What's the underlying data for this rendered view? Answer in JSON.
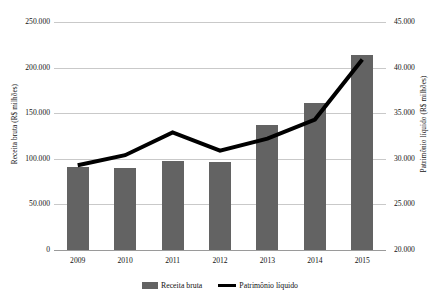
{
  "chart_data": {
    "type": "bar",
    "title": "",
    "subtitle": "",
    "xlabel": "",
    "categories": [
      "2009",
      "2010",
      "2011",
      "2012",
      "2013",
      "2014",
      "2015"
    ],
    "grid": true,
    "legend_position": "bottom",
    "series": [
      {
        "name": "Receita bruta",
        "type": "bar",
        "axis": "left",
        "color": "#636363",
        "values": [
          91000,
          90000,
          98000,
          97000,
          137000,
          161000,
          214000
        ]
      },
      {
        "name": "Patrimônio líquido",
        "type": "line",
        "axis": "right",
        "color": "#000000",
        "values": [
          29300,
          30400,
          32900,
          30900,
          32200,
          34300,
          40900
        ]
      }
    ],
    "axes": {
      "left": {
        "label": "Receita bruta (R$ milhões)",
        "min": 0,
        "max": 250000,
        "step": 50000,
        "ticks": [
          "250.000",
          "200.000",
          "150.000",
          "100.000",
          "50.000",
          "0"
        ],
        "tick_values": [
          250000,
          200000,
          150000,
          100000,
          50000,
          0
        ]
      },
      "right": {
        "label": "Patrimônio líquido (R$ milhões)",
        "min": 20000,
        "max": 45000,
        "step": 5000,
        "ticks": [
          "45.000",
          "40.000",
          "35.000",
          "30.000",
          "25.000",
          "20.000"
        ],
        "tick_values": [
          45000,
          40000,
          35000,
          30000,
          25000,
          20000
        ]
      }
    },
    "legend": [
      {
        "label": "Receita bruta",
        "marker": "bar",
        "color": "#636363"
      },
      {
        "label": "Patrimônio líquido",
        "marker": "line",
        "color": "#000000"
      }
    ]
  }
}
